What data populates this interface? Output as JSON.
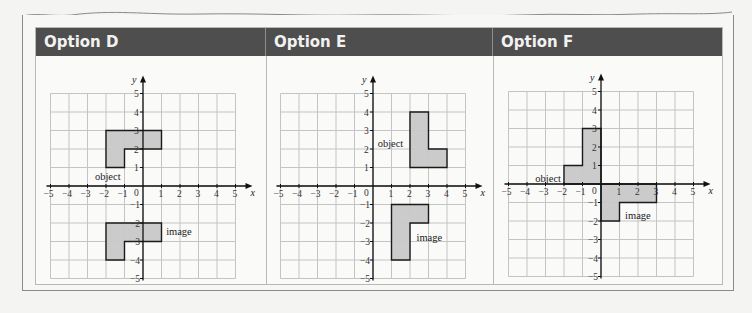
{
  "panels": [
    {
      "title": "Option D",
      "grid": {
        "xmin": -5,
        "xmax": 5,
        "ymin": -5,
        "ymax": 5
      },
      "object": {
        "label": "object",
        "vertices": [
          [
            -2,
            1
          ],
          [
            -2,
            3
          ],
          [
            1,
            3
          ],
          [
            1,
            2
          ],
          [
            -1,
            2
          ],
          [
            -1,
            1
          ]
        ],
        "label_pos": [
          -2.6,
          0.55
        ]
      },
      "image": {
        "label": "image",
        "vertices": [
          [
            -2,
            -4
          ],
          [
            -2,
            -2
          ],
          [
            1,
            -2
          ],
          [
            1,
            -3
          ],
          [
            -1,
            -3
          ],
          [
            -1,
            -4
          ]
        ],
        "label_pos": [
          1.25,
          -2.45
        ]
      }
    },
    {
      "title": "Option E",
      "grid": {
        "xmin": -5,
        "xmax": 5,
        "ymin": -5,
        "ymax": 5
      },
      "object": {
        "label": "object",
        "vertices": [
          [
            2,
            1
          ],
          [
            2,
            4
          ],
          [
            3,
            4
          ],
          [
            3,
            2
          ],
          [
            4,
            2
          ],
          [
            4,
            1
          ]
        ],
        "label_pos": [
          0.25,
          2.35
        ]
      },
      "image": {
        "label": "image",
        "vertices": [
          [
            1,
            -4
          ],
          [
            1,
            -1
          ],
          [
            3,
            -1
          ],
          [
            3,
            -2
          ],
          [
            2,
            -2
          ],
          [
            2,
            -4
          ]
        ],
        "label_pos": [
          2.35,
          -2.75
        ]
      }
    },
    {
      "title": "Option F",
      "grid": {
        "xmin": -5,
        "xmax": 5,
        "ymin": -5,
        "ymax": 5
      },
      "object": {
        "label": "object",
        "vertices": [
          [
            -2,
            0
          ],
          [
            -2,
            1
          ],
          [
            -1,
            1
          ],
          [
            -1,
            3
          ],
          [
            0,
            3
          ],
          [
            0,
            0
          ]
        ],
        "label_pos": [
          -3.55,
          0.35
        ]
      },
      "image": {
        "label": "image",
        "vertices": [
          [
            0,
            -2
          ],
          [
            0,
            0
          ],
          [
            3,
            0
          ],
          [
            3,
            -1
          ],
          [
            1,
            -1
          ],
          [
            1,
            -2
          ]
        ],
        "label_pos": [
          1.3,
          -1.65
        ]
      }
    }
  ],
  "axes": {
    "x_label": "x",
    "y_label": "y",
    "origin_label": "0",
    "x_ticks": [
      "−5",
      "−4",
      "−3",
      "−2",
      "−1",
      "1",
      "2",
      "3",
      "4",
      "5"
    ],
    "y_ticks": [
      "5",
      "4",
      "3",
      "2",
      "1",
      "−1",
      "−2",
      "−3",
      "−4",
      "−5"
    ]
  },
  "colors": {
    "header_bg": "#4e4e4e",
    "header_text": "#f2f2f2",
    "shape_fill": "#c8c8c8",
    "shape_stroke": "#1a1a1a",
    "grid_line": "#c4c4c4"
  }
}
